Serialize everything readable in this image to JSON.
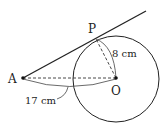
{
  "diagram": {
    "points": {
      "A": {
        "label": "A",
        "x": 23,
        "y": 78
      },
      "O": {
        "label": "O",
        "x": 116,
        "y": 78
      },
      "P": {
        "label": "P",
        "x": 95,
        "y": 39
      }
    },
    "circle": {
      "center": "O",
      "radius": 43
    },
    "tangent_line": {
      "from": "A",
      "through": "P",
      "end_x": 146,
      "end_y": 11
    },
    "segments": [
      {
        "from": "A",
        "to": "O",
        "style": "dashed"
      },
      {
        "from": "O",
        "to": "P",
        "style": "dashed"
      }
    ],
    "measurements": {
      "radius_label": "8 cm",
      "AO_label": "17 cm"
    },
    "colors": {
      "stroke": "#222222",
      "background": "#ffffff"
    }
  }
}
